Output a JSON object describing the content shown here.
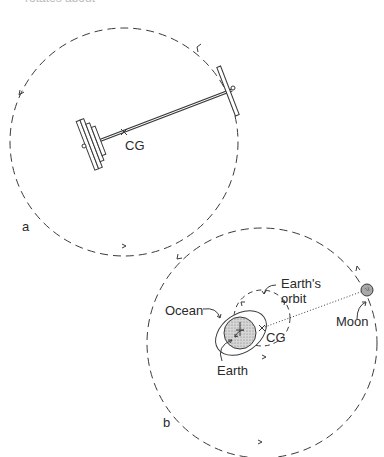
{
  "header": {
    "cut_text": "rotates about"
  },
  "panel_a": {
    "label": "a",
    "cg_label": "CG"
  },
  "panel_b": {
    "label": "b",
    "earths_orbit_line1": "Earth's",
    "earths_orbit_line2": "orbit",
    "ocean_label": "Ocean",
    "earth_label": "Earth",
    "cg_label": "CG",
    "moon_label": "Moon"
  },
  "colors": {
    "line": "#3a3a3a",
    "earth_fill": "#cfcfcf",
    "moon_fill": "#a8a8a8"
  }
}
